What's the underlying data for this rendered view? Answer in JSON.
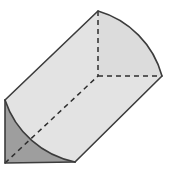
{
  "figure": {
    "type": "geometric-solid-diagram",
    "canvas": {
      "width": 173,
      "height": 173,
      "background": "#ffffff"
    },
    "colors": {
      "front_face_fill": "#9e9e9e",
      "top_face_fill": "#e3e3e3",
      "curved_surface_fill": "#d9d9d9",
      "back_face_fill": "#dcdcdc",
      "outline_stroke": "#3c3c3c",
      "hidden_edge_stroke": "#2e2e2e"
    },
    "stroke_widths": {
      "outline": 1.6,
      "hidden": 1.5,
      "arc": 1.6
    },
    "dash_pattern": "5,4",
    "vertices": {
      "front_top_left": [
        5,
        100
      ],
      "front_bottom_left": [
        5,
        163
      ],
      "front_bottom_right": [
        75,
        162
      ],
      "back_top": [
        98,
        11
      ],
      "back_center": [
        98,
        76
      ],
      "back_right": [
        162,
        76
      ],
      "back_bottom_right": [
        138,
        128
      ]
    },
    "parts": [
      {
        "name": "front-quarter-disc-face",
        "shading": "dark-gray",
        "description": "Quarter-disc cross-section facing viewer, center at front-bottom-left corner"
      },
      {
        "name": "top-rectangular-face",
        "shading": "light-gray",
        "description": "Flat vertical rectangular face running from front quarter-disc to back quarter-disc"
      },
      {
        "name": "left-rectangular-face",
        "shading": "light-gray",
        "description": "Flat bottom rectangular face of the prism"
      },
      {
        "name": "curved-lateral-surface",
        "shading": "light-gray",
        "description": "Swept quarter-cylindrical curved surface"
      },
      {
        "name": "back-quarter-disc-face",
        "shading": "light-gray",
        "description": "Rear quarter-disc cross-section, partly hidden"
      }
    ],
    "hidden_edges": [
      {
        "name": "back-vertical-radius",
        "from": [
          98,
          11
        ],
        "to": [
          98,
          76
        ]
      },
      {
        "name": "back-horizontal-radius",
        "from": [
          98,
          76
        ],
        "to": [
          161,
          76
        ]
      },
      {
        "name": "long-interior-diagonal",
        "from": [
          5,
          163
        ],
        "to": [
          98,
          76
        ]
      },
      {
        "name": "front-face-radius-diagonal",
        "from": [
          5,
          163
        ],
        "to": [
          76,
          162
        ]
      }
    ],
    "labels": []
  }
}
